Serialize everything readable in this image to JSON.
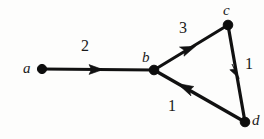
{
  "figure": {
    "name": "weighted-directed-graph",
    "background_color": "#fdfdfc",
    "ink_color": "#111111",
    "width": 264,
    "height": 139
  },
  "graph": {
    "nodes": [
      {
        "id": "a",
        "label": "a",
        "x": 42,
        "y": 69,
        "radius": 4.6,
        "label_x": 23,
        "label_y": 61
      },
      {
        "id": "b",
        "label": "b",
        "x": 154,
        "y": 70,
        "radius": 4.6,
        "label_x": 142,
        "label_y": 50
      },
      {
        "id": "c",
        "label": "c",
        "x": 228,
        "y": 25,
        "radius": 4.6,
        "label_x": 223,
        "label_y": 3
      },
      {
        "id": "d",
        "label": "d",
        "x": 245,
        "y": 122,
        "radius": 4.6,
        "label_x": 252,
        "label_y": 113
      }
    ],
    "edges": [
      {
        "id": "ab",
        "from": "a",
        "to": "b",
        "weight": "2",
        "directed": true,
        "arrow_t": 0.52,
        "label_x": 81,
        "label_y": 38
      },
      {
        "id": "bc",
        "from": "b",
        "to": "c",
        "weight": "3",
        "directed": true,
        "arrow_t": 0.5,
        "label_x": 179,
        "label_y": 20
      },
      {
        "id": "cd",
        "from": "c",
        "to": "d",
        "weight": "1",
        "directed": true,
        "arrow_t": 0.5,
        "label_x": 245,
        "label_y": 56
      },
      {
        "id": "db",
        "from": "d",
        "to": "b",
        "weight": "1",
        "directed": true,
        "arrow_t": 0.62,
        "label_x": 168,
        "label_y": 98
      }
    ]
  }
}
